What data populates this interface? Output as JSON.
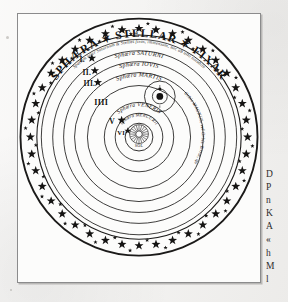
{
  "page": {
    "background_color": "#f4f3f1",
    "plate_background": "#fcfcfb",
    "frame_color": "#8b8b8c",
    "ink_color": "#1b1a19"
  },
  "plate": {
    "title": "SPHÆRA ✶ STELLAR ✶ FIXAR",
    "outer_inscription": "Spatium inter Saturnum & Stellas fixas, immensum, nec ab ullo notabile",
    "center_label": "SOL",
    "earth_orbit_inscription": "Orbis MAGNUS, vel Orbis Terræ, quarum Sphæra LUNÆ"
  },
  "spheres": [
    {
      "numeral": "I.",
      "star": "✶",
      "label": "Sphæra SATURNI",
      "radius": 92
    },
    {
      "numeral": "II.",
      "star": "✶",
      "label": "Sphæra IOVIS",
      "radius": 81
    },
    {
      "numeral": "III.",
      "star": "✶",
      "label": "Sphæra MARTIS",
      "radius": 70
    },
    {
      "numeral": "IIII",
      "star": "",
      "label": "",
      "radius": 55
    },
    {
      "numeral": "V",
      "star": "✶",
      "label": "Sphæra VENERIS",
      "radius": 36
    },
    {
      "numeral": "VI",
      "star": "✶",
      "label": "Sphæra MERCURII",
      "radius": 25
    }
  ],
  "star_band": {
    "outer_radius": 119,
    "inner_radius": 103,
    "large_star_count": 40,
    "small_star_count": 40
  },
  "margin_text": {
    "lines": [
      "D",
      "P",
      "n",
      "K",
      "A",
      "«",
      "h",
      "M",
      "l"
    ]
  }
}
